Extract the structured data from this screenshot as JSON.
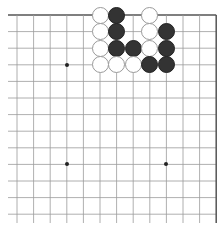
{
  "board": {
    "columns": 13,
    "rows": 13,
    "origin_x": 17,
    "origin_y": 15,
    "spacing": 16.6,
    "line_color": "#9a9a9a",
    "edge_color": "#555555",
    "edges": [
      "top",
      "right"
    ],
    "hoshi": [
      [
        4,
        4
      ],
      [
        4,
        10
      ],
      [
        10,
        4
      ],
      [
        10,
        10
      ]
    ],
    "stones": [
      {
        "color": "white",
        "col": 6,
        "row": 1
      },
      {
        "color": "black",
        "col": 7,
        "row": 1
      },
      {
        "color": "white",
        "col": 9,
        "row": 1
      },
      {
        "color": "white",
        "col": 6,
        "row": 2
      },
      {
        "color": "black",
        "col": 7,
        "row": 2
      },
      {
        "color": "white",
        "col": 9,
        "row": 2
      },
      {
        "color": "black",
        "col": 10,
        "row": 2
      },
      {
        "color": "white",
        "col": 6,
        "row": 3
      },
      {
        "color": "black",
        "col": 7,
        "row": 3
      },
      {
        "color": "black",
        "col": 8,
        "row": 3
      },
      {
        "color": "white",
        "col": 9,
        "row": 3
      },
      {
        "color": "black",
        "col": 10,
        "row": 3
      },
      {
        "color": "white",
        "col": 6,
        "row": 4
      },
      {
        "color": "white",
        "col": 7,
        "row": 4
      },
      {
        "color": "white",
        "col": 8,
        "row": 4
      },
      {
        "color": "black",
        "col": 9,
        "row": 4
      },
      {
        "color": "black",
        "col": 10,
        "row": 4
      }
    ]
  }
}
